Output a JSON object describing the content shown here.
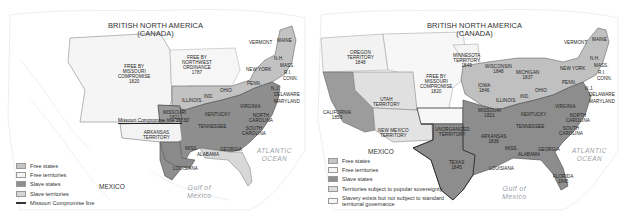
{
  "colors": {
    "background": "#ffffff",
    "free_state": "#c4c4c4",
    "free_territory": "#f4f4f4",
    "slave_state": "#8f8f8f",
    "slave_territory": "#d6d6d6",
    "popular_sovereignty": "#dcdcdc",
    "unorganized": "#f7f7f7",
    "border": "#555555",
    "water_label": "#9aa0a6",
    "terrain": "#e6e6e6"
  },
  "left_map": {
    "title_line1": "BRITISH NORTH AMERICA",
    "title_line2": "(CANADA)",
    "labels": {
      "free_by_missouri": [
        "FREE BY",
        "MISSOURI",
        "COMPROMISE",
        "1820"
      ],
      "free_by_northwest": [
        "FREE BY",
        "NORTHWEST",
        "ORDINANCE",
        "1787"
      ],
      "vermont": "VERMONT",
      "maine": "MAINE",
      "nh": "N.H.",
      "mass": "MASS.",
      "ri": "R.I.",
      "conn": "CONN.",
      "new_york": "NEW YORK",
      "penn": "PENN.",
      "nj": "N.J.",
      "delaware": "DELAWARE",
      "maryland": "MARYLAND",
      "ohio": "OHIO",
      "ind": "IND.",
      "illinois": "ILLINOIS",
      "missouri": [
        "MISSOURI",
        "1821"
      ],
      "kentucky": "KENTUCKY",
      "virginia": "VIRGINIA",
      "north_carolina": [
        "NORTH",
        "CAROLINA"
      ],
      "south_carolina": [
        "SOUTH",
        "CAROLINA"
      ],
      "tennessee": "TENNESSEE",
      "georgia": "GEORGIA",
      "alabama": "ALABAMA",
      "miss": "MISS.",
      "louisiana": "LOUISIANA",
      "arkansas_territory": [
        "ARKANSAS",
        "TERRITORY"
      ],
      "missouri_compromise_line": "Missouri Compromise line 36°30'",
      "mexico": "MEXICO",
      "atlantic": [
        "ATLANTIC",
        "OCEAN"
      ],
      "gulf": [
        "Gulf of",
        "Mexico"
      ]
    },
    "legend": [
      {
        "label": "Free states",
        "swatch": "free_state"
      },
      {
        "label": "Free territories",
        "swatch": "free_territory"
      },
      {
        "label": "Slave states",
        "swatch": "slave_state"
      },
      {
        "label": "Slave territories",
        "swatch": "slave_territory"
      },
      {
        "label": "Missouri Compromise line",
        "swatch": "line"
      }
    ]
  },
  "right_map": {
    "title_line1": "BRITISH NORTH AMERICA",
    "title_line2": "(CANADA)",
    "labels": {
      "oregon": [
        "OREGON",
        "TERRITORY",
        "1848"
      ],
      "minnesota": [
        "MINNESOTA",
        "TERRITORY",
        "1849"
      ],
      "free_by_missouri": [
        "FREE BY",
        "MISSOURI",
        "COMPROMISE",
        "1820"
      ],
      "utah": [
        "UTAH",
        "TERRITORY"
      ],
      "california": [
        "CALIFORNIA",
        "1850"
      ],
      "new_mexico": [
        "NEW MEXICO",
        "TERRITORY"
      ],
      "unorganized": [
        "UNORGANIZED",
        "TERRITORY"
      ],
      "wisconsin": [
        "WISCONSIN",
        "1848"
      ],
      "michigan": [
        "MICHIGAN",
        "1837"
      ],
      "iowa": [
        "IOWA",
        "1846"
      ],
      "vermont": "VERMONT",
      "maine": "MAINE",
      "nh": "N.H.",
      "mass": "MASS.",
      "ri": "R.I.",
      "conn": "CONN.",
      "new_york": "NEW YORK",
      "penn": "PENN.",
      "nj": "N.J.",
      "delaware": "DELAWARE",
      "maryland": "MARYLAND",
      "ohio": "OHIO",
      "ind": "IND.",
      "illinois": "ILLINOIS",
      "missouri": [
        "MISSOURI",
        "1821"
      ],
      "kentucky": "KENTUCKY",
      "virginia": "VIRGINIA",
      "north_carolina": [
        "NORTH",
        "CAROLINA"
      ],
      "south_carolina": [
        "SOUTH",
        "CAROLINA"
      ],
      "tennessee": "TENNESSEE",
      "arkansas": [
        "ARKANSAS",
        "1836"
      ],
      "georgia": "GEORGIA",
      "alabama": "ALABAMA",
      "miss": "MISS.",
      "louisiana": "LOUISIANA",
      "texas": [
        "TEXAS",
        "1845"
      ],
      "florida": [
        "FLORIDA",
        "1845"
      ],
      "mexico": "MEXICO",
      "atlantic": [
        "ATLANTIC",
        "OCEAN"
      ],
      "gulf": [
        "Gulf of",
        "Mexico"
      ]
    },
    "legend": [
      {
        "label": "Free states",
        "swatch": "free_state"
      },
      {
        "label": "Free territories",
        "swatch": "free_territory"
      },
      {
        "label": "Slave states",
        "swatch": "slave_state"
      },
      {
        "label": "Territories subject to popular sovereignty",
        "swatch": "popular_sovereignty"
      },
      {
        "label": "Slavery exists but not subject to standard territorial governance",
        "swatch": "unorganized"
      }
    ]
  }
}
